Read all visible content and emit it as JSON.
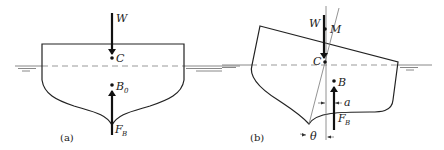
{
  "figure": {
    "panel_a": {
      "caption": "(a)",
      "labels": {
        "weight": "W",
        "center_of_gravity": "C",
        "center_of_buoyancy": "B",
        "center_of_buoyancy_sub": "0",
        "buoyant_force": "F",
        "buoyant_force_sub": "B"
      }
    },
    "panel_b": {
      "caption": "(b)",
      "labels": {
        "weight": "W",
        "metacenter": "M",
        "center_of_gravity": "C",
        "center_of_buoyancy": "B",
        "buoyant_force": "F",
        "buoyant_force_sub": "B",
        "offset": "a",
        "heel_angle": "θ"
      }
    },
    "colors": {
      "line": "#222222",
      "water": "#888888",
      "background": "#ffffff"
    }
  }
}
